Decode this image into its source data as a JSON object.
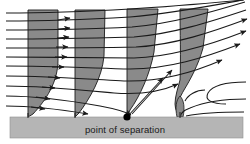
{
  "figure": {
    "title_label": "point of separation",
    "colors": {
      "profile_fill": "#8a8a8a",
      "wall_fill": "#b5b5b5",
      "stroke": "#1a1a1a",
      "background": "#ffffff",
      "separation_dot": "#000000"
    },
    "wall": {
      "x": 10,
      "y": 117,
      "width": 233,
      "height": 21,
      "label": "point of separation"
    },
    "separation_point": {
      "x": 127,
      "y": 117,
      "radius": 3.6
    },
    "profiles": [
      {
        "name": "profile-1-attached",
        "x_wall": 28,
        "top_y": 10,
        "top_width": 30,
        "state": "attached"
      },
      {
        "name": "profile-2-decelerating",
        "x_wall": 75,
        "top_y": 10,
        "top_width": 30,
        "state": "decelerating"
      },
      {
        "name": "profile-3-separation",
        "x_wall": 127,
        "top_y": 9,
        "top_width": 31,
        "state": "zero wall shear"
      },
      {
        "name": "profile-4-reversed",
        "x_wall": 180,
        "top_y": 9,
        "top_width": 28,
        "state": "reversed flow"
      }
    ],
    "streamlines": {
      "count": 11,
      "direction": "left to right",
      "arrowheads": "true"
    },
    "icon_names": [
      "separation-point-dot",
      "flow-arrow",
      "recirculation-curve"
    ]
  }
}
